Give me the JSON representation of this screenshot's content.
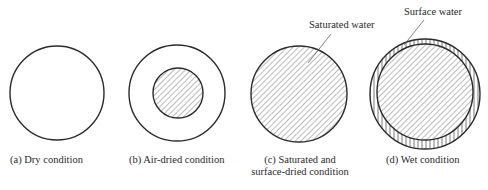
{
  "figure": {
    "panels": [
      {
        "id": "a",
        "caption": "(a)  Dry condition",
        "state": "dry",
        "outer_radius": 47,
        "inner_hatched_radius": 0,
        "surface_water_ring": false
      },
      {
        "id": "b",
        "caption": "(b)  Air-dried condition",
        "state": "air-dried",
        "outer_radius": 48,
        "inner_hatched_radius": 25,
        "surface_water_ring": false
      },
      {
        "id": "c",
        "caption_line1": "(c)  Saturated and",
        "caption_line2": "surface-dried condition",
        "state": "saturated-surface-dry",
        "outer_radius": 48,
        "inner_hatched_radius": 48,
        "surface_water_ring": false,
        "annotation": "Saturated water"
      },
      {
        "id": "d",
        "caption": "(d)  Wet condition",
        "state": "wet",
        "outer_radius": 55,
        "inner_hatched_radius": 48,
        "surface_water_ring": true,
        "annotation": "Surface water"
      }
    ],
    "legend": {
      "diagonal_hatch": "Saturated water",
      "vertical_hatch": "Surface water"
    },
    "colors": {
      "stroke": "#2b2b2b",
      "hatch": "#777777",
      "background": "#ffffff"
    }
  }
}
